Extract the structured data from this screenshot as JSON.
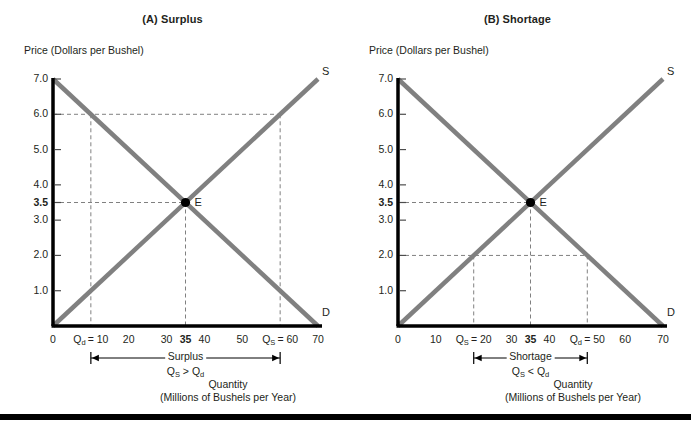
{
  "figure": {
    "bottom_rule": true,
    "colors": {
      "curve": "#808080",
      "axis": "#000000",
      "dash": "#808080",
      "text": "#231f20"
    }
  },
  "chart_data": [
    {
      "type": "line",
      "title": "(A) Surplus",
      "xlabel_line1": "Quantity",
      "xlabel_line2": "(Millions of Bushels per Year)",
      "ylabel_line1": "Price",
      "ylabel_line2": "(Dollars per Bushel)",
      "xlim": [
        0,
        70
      ],
      "ylim": [
        0,
        7
      ],
      "grid": false,
      "legend": "inline-curve-labels",
      "yticks": [
        {
          "value": 7.0,
          "label": "7.0",
          "bold": false
        },
        {
          "value": 6.0,
          "label": "6.0",
          "bold": false
        },
        {
          "value": 5.0,
          "label": "5.0",
          "bold": false
        },
        {
          "value": 4.0,
          "label": "4.0",
          "bold": false
        },
        {
          "value": 3.5,
          "label": "3.5",
          "bold": true
        },
        {
          "value": 3.0,
          "label": "3.0",
          "bold": false
        },
        {
          "value": 2.0,
          "label": "2.0",
          "bold": false
        },
        {
          "value": 1.0,
          "label": "1.0",
          "bold": false
        }
      ],
      "xticks": [
        {
          "value": 0,
          "label": "0",
          "bold": false,
          "html": "0"
        },
        {
          "value": 10,
          "label": "Qd = 10",
          "bold": false,
          "html": "Q<sub>d</sub>&thinsp;= 10"
        },
        {
          "value": 20,
          "label": "20",
          "bold": false,
          "html": "20"
        },
        {
          "value": 30,
          "label": "30",
          "bold": false,
          "html": "30"
        },
        {
          "value": 35,
          "label": "35",
          "bold": true,
          "html": "35"
        },
        {
          "value": 40,
          "label": "40",
          "bold": false,
          "html": "40"
        },
        {
          "value": 50,
          "label": "50",
          "bold": false,
          "html": "50"
        },
        {
          "value": 60,
          "label": "Qs = 60",
          "bold": false,
          "html": "Q<sub>S</sub>&thinsp;= 60"
        },
        {
          "value": 70,
          "label": "70",
          "bold": false,
          "html": "70"
        }
      ],
      "series": [
        {
          "name": "D",
          "label": "D",
          "type": "demand",
          "points": [
            [
              0,
              7.0
            ],
            [
              70,
              0.0
            ]
          ]
        },
        {
          "name": "S",
          "label": "S",
          "type": "supply",
          "points": [
            [
              0,
              0.0
            ],
            [
              70,
              7.0
            ]
          ]
        }
      ],
      "equilibrium": {
        "label": "E",
        "price": 3.5,
        "quantity": 35
      },
      "annotation": {
        "price_line": 6.0,
        "quantity_demanded": 10,
        "quantity_supplied": 60,
        "gap_label": "Surplus",
        "gap_relation": "QS > Qd",
        "gap_relation_html": "Q<sub>S</sub> &gt; Q<sub>d</sub>"
      }
    },
    {
      "type": "line",
      "title": "(B) Shortage",
      "xlabel_line1": "Quantity",
      "xlabel_line2": "(Millions of Bushels per Year)",
      "ylabel_line1": "Price",
      "ylabel_line2": "(Dollars per Bushel)",
      "xlim": [
        0,
        70
      ],
      "ylim": [
        0,
        7
      ],
      "grid": false,
      "legend": "inline-curve-labels",
      "yticks": [
        {
          "value": 7.0,
          "label": "7.0",
          "bold": false
        },
        {
          "value": 6.0,
          "label": "6.0",
          "bold": false
        },
        {
          "value": 5.0,
          "label": "5.0",
          "bold": false
        },
        {
          "value": 4.0,
          "label": "4.0",
          "bold": false
        },
        {
          "value": 3.5,
          "label": "3.5",
          "bold": true
        },
        {
          "value": 3.0,
          "label": "3.0",
          "bold": false
        },
        {
          "value": 2.0,
          "label": "2.0",
          "bold": false
        },
        {
          "value": 1.0,
          "label": "1.0",
          "bold": false
        }
      ],
      "xticks": [
        {
          "value": 0,
          "label": "0",
          "bold": false,
          "html": "0"
        },
        {
          "value": 10,
          "label": "10",
          "bold": false,
          "html": "10"
        },
        {
          "value": 20,
          "label": "Qs = 20",
          "bold": false,
          "html": "Q<sub>S</sub>&thinsp;= 20"
        },
        {
          "value": 30,
          "label": "30",
          "bold": false,
          "html": "30"
        },
        {
          "value": 35,
          "label": "35",
          "bold": true,
          "html": "35"
        },
        {
          "value": 40,
          "label": "40",
          "bold": false,
          "html": "40"
        },
        {
          "value": 50,
          "label": "Qd = 50",
          "bold": false,
          "html": "Q<sub>d</sub>&thinsp;= 50"
        },
        {
          "value": 60,
          "label": "60",
          "bold": false,
          "html": "60"
        },
        {
          "value": 70,
          "label": "70",
          "bold": false,
          "html": "70"
        }
      ],
      "series": [
        {
          "name": "D",
          "label": "D",
          "type": "demand",
          "points": [
            [
              0,
              7.0
            ],
            [
              70,
              0.0
            ]
          ]
        },
        {
          "name": "S",
          "label": "S",
          "type": "supply",
          "points": [
            [
              0,
              0.0
            ],
            [
              70,
              7.0
            ]
          ]
        }
      ],
      "equilibrium": {
        "label": "E",
        "price": 3.5,
        "quantity": 35
      },
      "annotation": {
        "price_line": 2.0,
        "quantity_supplied": 20,
        "quantity_demanded": 50,
        "gap_label": "Shortage",
        "gap_relation": "QS < Qd",
        "gap_relation_html": "Q<sub>S</sub> &lt; Q<sub>d</sub>"
      }
    }
  ]
}
